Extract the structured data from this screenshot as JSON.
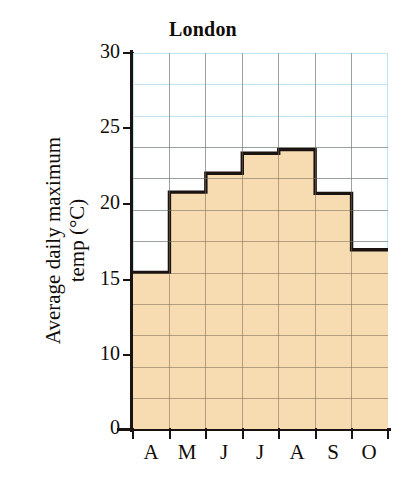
{
  "chart_data": {
    "type": "bar",
    "title": "London",
    "xlabel": "",
    "ylabel": "Average daily maximum\ntemp (°C)",
    "categories": [
      "A",
      "M",
      "J",
      "J",
      "A",
      "S",
      "O"
    ],
    "category_names": [
      "April",
      "May",
      "June",
      "July",
      "August",
      "September",
      "October"
    ],
    "values": [
      12.5,
      18.9,
      20.4,
      22.0,
      22.3,
      18.8,
      14.3
    ],
    "ylim": [
      0,
      30
    ],
    "ytick_labels": [
      "0",
      "10",
      "15",
      "20",
      "25",
      "30"
    ],
    "ytick_values": [
      0,
      10,
      15,
      20,
      25,
      30
    ],
    "grid": true,
    "grid_step": 2.5,
    "legend": "none",
    "series_name": "Average daily maximum temp",
    "units": "°C"
  },
  "style": {
    "fill_color": "#f6dcb0",
    "outline_color": "#1a1310",
    "grid_color": "#bfe4f2",
    "text_color": "#100c08",
    "background": "#ffffff"
  },
  "axes": {
    "y_title_line1": "Average daily maximum",
    "y_title_line2": "temp (°C)",
    "x_labels": [
      "A",
      "M",
      "J",
      "J",
      "A",
      "S",
      "O"
    ],
    "y_labels": [
      "30",
      "25",
      "20",
      "15",
      "10",
      "0"
    ]
  }
}
